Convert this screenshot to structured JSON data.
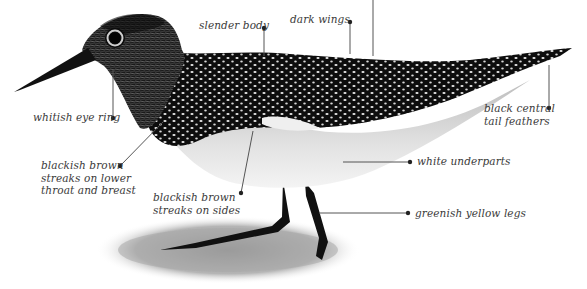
{
  "diagram": {
    "labels": [
      {
        "id": "slender-body",
        "text": "slender body",
        "x": 199,
        "y": 19
      },
      {
        "id": "dark-wings",
        "text": "dark wings",
        "x": 290,
        "y": 13
      },
      {
        "id": "whitish-eye-ring",
        "text": "whitish eye ring",
        "x": 33,
        "y": 111
      },
      {
        "id": "blackish-brown-throat",
        "text": "blackish brown\nstreaks on lower\nthroat and breast",
        "x": 41,
        "y": 159
      },
      {
        "id": "blackish-brown-sides",
        "text": "blackish brown\nstreaks on sides",
        "x": 153,
        "y": 191
      },
      {
        "id": "black-central-tail",
        "text": "black central\ntail feathers",
        "x": 484,
        "y": 102
      },
      {
        "id": "white-underparts",
        "text": "white underparts",
        "x": 417,
        "y": 155
      },
      {
        "id": "greenish-yellow-legs",
        "text": "greenish yellow legs",
        "x": 415,
        "y": 207
      }
    ],
    "colors": {
      "text": "#3a3a3a",
      "leader_line": "#555555",
      "bird_dark": "#0d0d0d",
      "bird_light": "#e6e6e6",
      "ground": "#9a9a9a"
    }
  }
}
